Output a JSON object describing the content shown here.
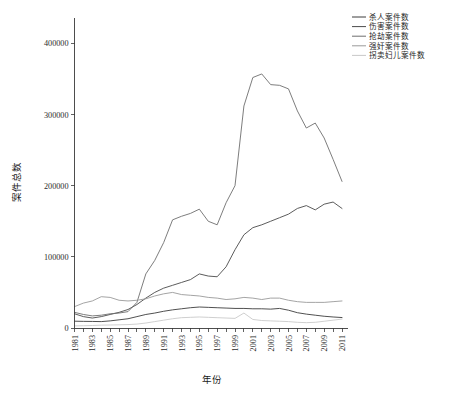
{
  "chart_data": {
    "type": "line",
    "title": "",
    "xlabel": "年份",
    "ylabel": "案件总数",
    "xlim": [
      1981,
      2011
    ],
    "ylim": [
      0,
      430000
    ],
    "yticks": [
      0,
      100000,
      200000,
      300000,
      400000
    ],
    "ytick_labels": [
      "0",
      "100000",
      "200000",
      "300000",
      "400000"
    ],
    "grid": false,
    "legend_position": "top-right",
    "x": [
      1981,
      1982,
      1983,
      1984,
      1985,
      1986,
      1987,
      1988,
      1989,
      1990,
      1991,
      1992,
      1993,
      1994,
      1995,
      1996,
      1997,
      1998,
      1999,
      2000,
      2001,
      2002,
      2003,
      2004,
      2005,
      2006,
      2007,
      2008,
      2009,
      2010,
      2011
    ],
    "xtick_labels": [
      "1981",
      "1983",
      "1985",
      "1987",
      "1989",
      "1991",
      "1993",
      "1995",
      "1997",
      "1999",
      "2001",
      "2003",
      "2005",
      "2007",
      "2009",
      "2011"
    ],
    "series": [
      {
        "name": "杀人案件数",
        "color": "#3c3c3c",
        "values": [
          9576,
          9310,
          9200,
          9000,
          10000,
          11500,
          13000,
          16000,
          19000,
          21000,
          23500,
          25500,
          27000,
          28500,
          29500,
          29000,
          28500,
          28000,
          27500,
          27500,
          27000,
          27000,
          26500,
          27500,
          25000,
          21500,
          19500,
          18000,
          16500,
          15500,
          14700
        ]
      },
      {
        "name": "伤害案件数",
        "color": "#4a4a4a",
        "values": [
          20000,
          16000,
          14000,
          16000,
          19000,
          22000,
          26000,
          33000,
          42000,
          50000,
          56000,
          60000,
          64000,
          68000,
          76000,
          73000,
          72000,
          86000,
          110000,
          131000,
          141000,
          145000,
          150000,
          155000,
          160000,
          168000,
          172000,
          166000,
          174000,
          177000,
          168000
        ]
      },
      {
        "name": "抢劫案件数",
        "color": "#6e6e6e",
        "values": [
          22000,
          19000,
          17000,
          18000,
          20000,
          21000,
          23000,
          36000,
          76000,
          95000,
          120000,
          152000,
          157000,
          161000,
          167000,
          150000,
          145000,
          176000,
          200000,
          312000,
          352000,
          357000,
          342000,
          341000,
          336000,
          305000,
          281000,
          288000,
          267000,
          237000,
          206000
        ]
      },
      {
        "name": "强奸案件数",
        "color": "#9a9a9a",
        "values": [
          30000,
          35000,
          38000,
          44000,
          43000,
          39000,
          38000,
          39000,
          41000,
          45000,
          48000,
          50000,
          47000,
          46000,
          45000,
          43000,
          42000,
          40000,
          41000,
          43000,
          42000,
          40000,
          42000,
          42000,
          39000,
          37000,
          36000,
          36000,
          36000,
          37000,
          38000
        ]
      },
      {
        "name": "拐卖妇儿案件数",
        "color": "#c9c9c9",
        "values": [
          3000,
          3200,
          3500,
          4000,
          4200,
          4500,
          4800,
          5500,
          7000,
          9000,
          11000,
          13000,
          14500,
          15000,
          15500,
          15000,
          14500,
          14000,
          13500,
          21000,
          12000,
          10500,
          10000,
          9500,
          9000,
          8000,
          7500,
          8000,
          9500,
          11000,
          12500
        ]
      }
    ]
  },
  "axes": {
    "ylabel": "案件总数",
    "xlabel": "年份"
  },
  "legend": {
    "entries": [
      {
        "label": "杀人案件数"
      },
      {
        "label": "伤害案件数"
      },
      {
        "label": "抢劫案件数"
      },
      {
        "label": "强奸案件数"
      },
      {
        "label": "拐卖妇儿案件数"
      }
    ]
  },
  "caption": {
    "text": ""
  }
}
